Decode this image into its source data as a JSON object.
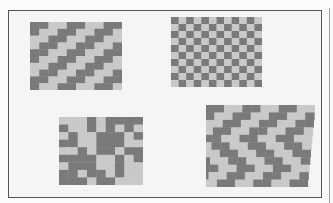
{
  "scene": {
    "description": "Scanned photograph of four woven paper mats demonstrating different weave patterns, inside a rectangular frame",
    "colors": {
      "background": "#f5f5f5",
      "frame_border": "#555555",
      "dark_strip": "#7a7a7a",
      "light_strip": "#c9c9c9"
    }
  },
  "mats": [
    {
      "id": "twill-diagonal",
      "position": "top-left",
      "pattern": "diagonal twill (2-over-2 stepped stripes)",
      "box": {
        "x": 30,
        "y": 22,
        "w": 92,
        "h": 68
      },
      "cols": 10,
      "rows": 10
    },
    {
      "id": "plain-checker",
      "position": "top-right",
      "pattern": "plain weave checkerboard",
      "box": {
        "x": 171,
        "y": 17,
        "w": 91,
        "h": 70
      },
      "cols": 12,
      "rows": 10
    },
    {
      "id": "irregular-blocks",
      "position": "bottom-left",
      "pattern": "irregular block weave",
      "box": {
        "x": 59,
        "y": 117,
        "w": 84,
        "h": 68
      },
      "cols": 9,
      "rows": 9
    },
    {
      "id": "zigzag-twill",
      "position": "bottom-right",
      "pattern": "zigzag / broken twill",
      "box": {
        "x": 206,
        "y": 105,
        "w": 109,
        "h": 82
      },
      "cols": 12,
      "rows": 11
    }
  ]
}
